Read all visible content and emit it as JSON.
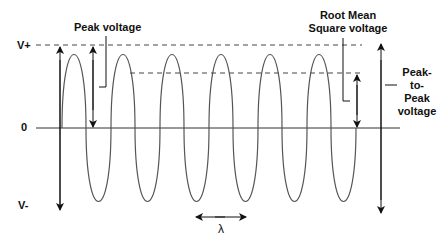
{
  "diagram": {
    "axis_labels": {
      "v_plus": "V+",
      "zero": "0",
      "v_minus": "V-"
    },
    "annotations": {
      "peak_voltage": "Peak voltage",
      "rms_line1": "Root Mean",
      "rms_line2": "Square voltage",
      "p2p_line1": "Peak-",
      "p2p_line2": "to-",
      "p2p_line3": "Peak",
      "p2p_line4": "voltage",
      "wavelength": "λ"
    },
    "wave": {
      "cycles": 6,
      "stroke_color": "#555555"
    },
    "colors": {
      "line": "#111111",
      "wave": "#555555",
      "dash": "#444444"
    }
  }
}
